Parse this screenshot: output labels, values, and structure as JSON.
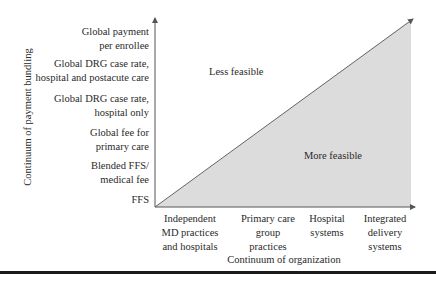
{
  "diagram": {
    "y_axis_title": "Continuum of payment bundling",
    "x_axis_title": "Continuum of organization",
    "y_levels": [
      {
        "lines": [
          "Global payment",
          "per enrollee"
        ]
      },
      {
        "lines": [
          "Global DRG case rate,",
          "hospital and postacute care"
        ]
      },
      {
        "lines": [
          "Global DRG case rate,",
          "hospital only"
        ]
      },
      {
        "lines": [
          "Global fee for",
          "primary care"
        ]
      },
      {
        "lines": [
          "Blended FFS/",
          "medical fee"
        ]
      },
      {
        "lines": [
          "FFS"
        ]
      }
    ],
    "x_categories": [
      {
        "lines": [
          "Independent",
          "MD practices",
          "and hospitals"
        ]
      },
      {
        "lines": [
          "Primary care",
          "group",
          "practices"
        ]
      },
      {
        "lines": [
          "Hospital",
          "systems"
        ]
      },
      {
        "lines": [
          "Integrated",
          "delivery",
          "systems"
        ]
      }
    ],
    "regions": {
      "upper": "Less feasible",
      "lower": "More feasible"
    },
    "colors": {
      "feasible_fill": "#dcdcdc",
      "axis": "#555555",
      "rule": "#1a1a1a"
    }
  }
}
